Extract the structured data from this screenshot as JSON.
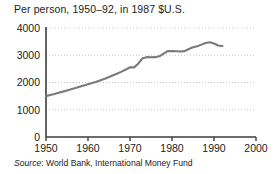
{
  "chart_data": {
    "type": "line",
    "title": "Per person, 1950–92, in 1987 $U.S.",
    "subtitle": "",
    "xlabel": "",
    "ylabel": "",
    "source": "Source: World Bank, International Money Fund",
    "source_prefix": "Source",
    "source_rest": ": World Bank, International Money Fund",
    "xlim": [
      1950,
      2000
    ],
    "ylim": [
      0,
      4000
    ],
    "xticks": [
      1950,
      1960,
      1970,
      1980,
      1990,
      2000
    ],
    "xtick_labels": [
      "1950",
      "1960",
      "1970",
      "1980",
      "1990",
      "2000"
    ],
    "yticks": [
      0,
      1000,
      2000,
      3000,
      4000
    ],
    "ytick_labels": [
      "0",
      "1000",
      "2000",
      "3000",
      "4000"
    ],
    "grid": true,
    "grid_style": "dotted",
    "grid_color": "#c9c9c9",
    "line_color": "#7a7a7a",
    "axis_color": "#3c3c3c",
    "legend": null,
    "series": [
      {
        "name": "Per person GDP (1987 $U.S.)",
        "x": [
          1950,
          1951,
          1952,
          1953,
          1954,
          1955,
          1956,
          1957,
          1958,
          1959,
          1960,
          1961,
          1962,
          1963,
          1964,
          1965,
          1966,
          1967,
          1968,
          1969,
          1970,
          1971,
          1972,
          1973,
          1974,
          1975,
          1976,
          1977,
          1978,
          1979,
          1980,
          1981,
          1982,
          1983,
          1984,
          1985,
          1986,
          1987,
          1988,
          1989,
          1990,
          1991,
          1992
        ],
        "values": [
          1500,
          1540,
          1580,
          1625,
          1665,
          1710,
          1755,
          1800,
          1845,
          1890,
          1935,
          1980,
          2030,
          2085,
          2140,
          2200,
          2265,
          2330,
          2400,
          2475,
          2560,
          2555,
          2700,
          2890,
          2930,
          2925,
          2930,
          2960,
          3060,
          3150,
          3150,
          3145,
          3140,
          3150,
          3230,
          3290,
          3330,
          3390,
          3450,
          3480,
          3430,
          3360,
          3340
        ]
      }
    ]
  },
  "geometry": {
    "plot_left": 46,
    "plot_right": 256,
    "plot_top": 28,
    "plot_bottom": 137
  }
}
